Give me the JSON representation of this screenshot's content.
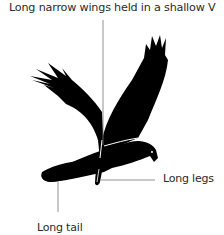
{
  "diagram": {
    "colors": {
      "silhouette": "#000000",
      "pointer_line": "#777777",
      "label_text": "#2a2a2a",
      "background": "#ffffff"
    },
    "labels": {
      "wings": "Long narrow wings held in a shallow V",
      "legs": "Long legs",
      "tail": "Long tail"
    }
  }
}
